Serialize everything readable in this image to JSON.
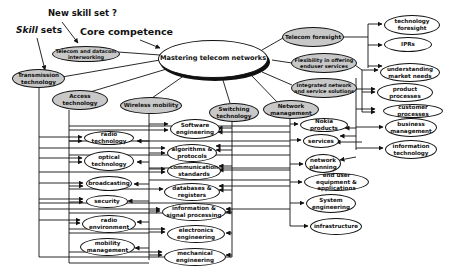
{
  "annotations": {
    "new_skill_set": "New skill set ?",
    "core_competence": "Core competence",
    "skill_sets_italic": "Skill",
    "skill_sets_rest": " sets"
  },
  "center": {
    "label": "Mastering telecom networks"
  },
  "core_nodes": [
    {
      "id": "telecom-datacom",
      "label": "Telecom and datacom interworking"
    },
    {
      "id": "transmission",
      "label": "Transmission technology"
    },
    {
      "id": "access",
      "label": "Access technology"
    },
    {
      "id": "wireless",
      "label": "Wireless mobility"
    },
    {
      "id": "switching",
      "label": "Switching technology"
    },
    {
      "id": "network-mgmt",
      "label": "Network management"
    },
    {
      "id": "telecom-foresight",
      "label": "Telecom foresight"
    },
    {
      "id": "flexibility",
      "label": "Flexibility in offering enduser services"
    },
    {
      "id": "integrated",
      "label": "Integrated network and service solutions"
    }
  ],
  "skill_nodes_left": [
    {
      "id": "radio-tech",
      "label": "radio technology"
    },
    {
      "id": "optical",
      "label": "optical technology"
    },
    {
      "id": "broadcasting",
      "label": "broadcasting"
    },
    {
      "id": "security",
      "label": "security"
    },
    {
      "id": "radio-env",
      "label": "radio environment"
    },
    {
      "id": "mobility-mgmt",
      "label": "mobility management"
    }
  ],
  "skill_nodes_middle": [
    {
      "id": "software-eng",
      "label": "Software engineering"
    },
    {
      "id": "algorithms",
      "label": "algorithms & protocols"
    },
    {
      "id": "comm-standards",
      "label": "communication standards"
    },
    {
      "id": "databases",
      "label": "databases & registers"
    },
    {
      "id": "info-signal",
      "label": "information & signal processing"
    },
    {
      "id": "electronics",
      "label": "electronics engineering"
    },
    {
      "id": "mechanical",
      "label": "mechanical engineering"
    }
  ],
  "skill_nodes_netmgmt": [
    {
      "id": "nokia-products",
      "label": "Nokia products"
    },
    {
      "id": "services",
      "label": "services"
    },
    {
      "id": "network-planning",
      "label": "network planning"
    },
    {
      "id": "end-user",
      "label": "end user equipment & applications"
    },
    {
      "id": "system-eng",
      "label": "System engineering"
    },
    {
      "id": "infrastructure",
      "label": "infrastructure"
    }
  ],
  "skill_nodes_right": [
    {
      "id": "tech-foresight",
      "label": "technology foresight"
    },
    {
      "id": "iprs",
      "label": "IPRs"
    },
    {
      "id": "market-needs",
      "label": "understanding market needs"
    },
    {
      "id": "product-processes",
      "label": "product processes"
    },
    {
      "id": "customer-processes",
      "label": "customer processes"
    },
    {
      "id": "business-mgmt",
      "label": "business management"
    },
    {
      "id": "info-tech",
      "label": "information technology"
    }
  ],
  "colors": {
    "core_fill": "#c8c8c8",
    "stroke": "#111111",
    "background": "#ffffff"
  }
}
